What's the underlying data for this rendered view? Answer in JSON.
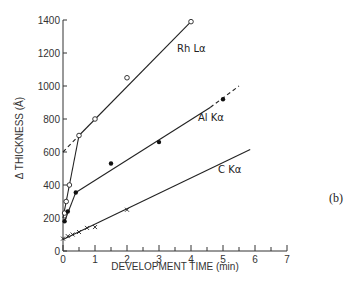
{
  "chart_data": {
    "type": "line",
    "title": "",
    "panel_label": "(b)",
    "xlabel": "DEVELOPMENT TIME (min)",
    "ylabel": "Δ THICKNESS (Å)",
    "xlim": [
      0,
      7
    ],
    "ylim": [
      0,
      1400
    ],
    "x_ticks": [
      "0",
      "1",
      "2",
      "3",
      "4",
      "5",
      "6",
      "7"
    ],
    "y_ticks": [
      "0",
      "200",
      "400",
      "600",
      "800",
      "1000",
      "1200",
      "1400"
    ],
    "grid": false,
    "legend": "inline labels",
    "series": [
      {
        "name": "Rh Lα",
        "marker": "open-circle",
        "points": [
          [
            0.05,
            230
          ],
          [
            0.1,
            300
          ],
          [
            0.2,
            400
          ],
          [
            0.5,
            700
          ],
          [
            1.0,
            800
          ],
          [
            2.0,
            1050
          ],
          [
            4.0,
            1390
          ]
        ],
        "fit_lines": [
          {
            "style": "solid",
            "from": [
              0,
              200
            ],
            "to": [
              0.5,
              700
            ]
          },
          {
            "style": "solid",
            "from": [
              0.5,
              700
            ],
            "to": [
              4.0,
              1390
            ]
          },
          {
            "style": "dashed",
            "from": [
              0,
              600
            ],
            "to": [
              0.5,
              700
            ]
          }
        ]
      },
      {
        "name": "Al Kα",
        "marker": "filled-circle",
        "points": [
          [
            0.05,
            180
          ],
          [
            0.15,
            240
          ],
          [
            0.4,
            355
          ],
          [
            1.5,
            530
          ],
          [
            3.0,
            660
          ],
          [
            5.0,
            920
          ]
        ],
        "fit_lines": [
          {
            "style": "solid",
            "from": [
              0.05,
              180
            ],
            "to": [
              0.4,
              355
            ]
          },
          {
            "style": "solid",
            "from": [
              0.4,
              355
            ],
            "to": [
              4.6,
              870
            ]
          },
          {
            "style": "dashed",
            "from": [
              4.6,
              870
            ],
            "to": [
              5.5,
              1000
            ]
          }
        ]
      },
      {
        "name": "C Kα",
        "marker": "cross",
        "points": [
          [
            0.0,
            75
          ],
          [
            0.15,
            90
          ],
          [
            0.3,
            100
          ],
          [
            0.5,
            115
          ],
          [
            0.75,
            140
          ],
          [
            1.0,
            145
          ],
          [
            2.0,
            250
          ]
        ],
        "fit_lines": [
          {
            "style": "solid",
            "from": [
              0,
              70
            ],
            "to": [
              5.85,
              615
            ]
          }
        ]
      }
    ]
  },
  "labels": {
    "rh": "Rh Lα",
    "al": "Al Kα",
    "c": "C Kα",
    "panel": "(b)",
    "xlabel": "DEVELOPMENT TIME (min)",
    "ylabel": "Δ THICKNESS (Å)",
    "origin_y": "0",
    "origin_x": "0"
  }
}
